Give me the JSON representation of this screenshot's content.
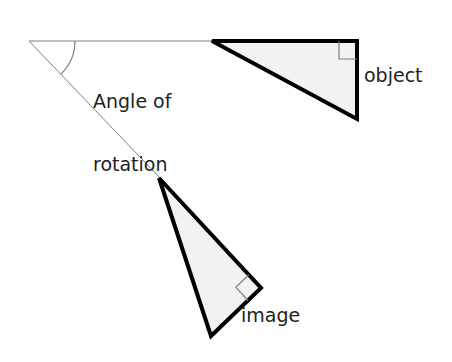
{
  "diagram": {
    "title_text": "Angle of rotation",
    "labels": {
      "angle_of_rotation_line1": "Angle of",
      "angle_of_rotation_line2": "rotation",
      "object": "object",
      "image": "image"
    },
    "colors": {
      "background": "#ffffff",
      "shape_outline": "#000000",
      "shape_fill": "#f2f2f2",
      "ray_line": "#808080",
      "arc_line": "#808080",
      "right_angle_marker": "#808080",
      "text": "#231f20"
    },
    "stroke_widths": {
      "shape_outline": 4,
      "ray_line": 1,
      "arc_line": 1.2,
      "right_angle_marker": 1.2
    },
    "center_of_rotation": {
      "x": 29,
      "y": 41
    },
    "rays": [
      {
        "name": "horizontal-ray",
        "x1": 29,
        "y1": 41,
        "x2": 214,
        "y2": 41
      },
      {
        "name": "rotated-ray",
        "x1": 29,
        "y1": 41,
        "x2": 160,
        "y2": 178
      }
    ],
    "angle_arc": {
      "radius": 46,
      "start_angle_deg": 0,
      "end_angle_deg": 46,
      "sweep": "clockwise-screen"
    },
    "object_triangle": {
      "name": "object",
      "points": [
        {
          "x": 212,
          "y": 41
        },
        {
          "x": 357,
          "y": 41
        },
        {
          "x": 357,
          "y": 119
        }
      ],
      "right_angle_vertex": {
        "x": 357,
        "y": 41
      },
      "right_angle_marker_size": 18
    },
    "image_triangle": {
      "name": "image",
      "points": [
        {
          "x": 159,
          "y": 178
        },
        {
          "x": 261,
          "y": 288
        },
        {
          "x": 211,
          "y": 336
        }
      ],
      "right_angle_vertex": {
        "x": 261,
        "y": 288
      },
      "right_angle_marker_size": 18
    }
  }
}
